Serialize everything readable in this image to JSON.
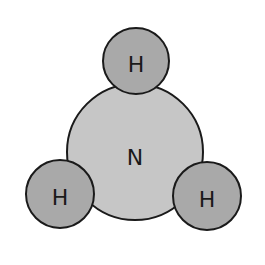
{
  "diagram": {
    "colors": {
      "nitrogen_fill": "#c6c6c6",
      "hydrogen_fill": "#a9a9a9",
      "outline": "#1a1a1a",
      "background": "#ffffff"
    },
    "atoms": [
      {
        "id": "n",
        "label": "N",
        "cx": 135,
        "cy": 152,
        "r": 68
      },
      {
        "id": "h-top",
        "label": "H",
        "cx": 136,
        "cy": 61,
        "r": 33
      },
      {
        "id": "h-left",
        "label": "H",
        "cx": 60,
        "cy": 194,
        "r": 34
      },
      {
        "id": "h-right",
        "label": "H",
        "cx": 207,
        "cy": 196,
        "r": 34
      }
    ]
  }
}
